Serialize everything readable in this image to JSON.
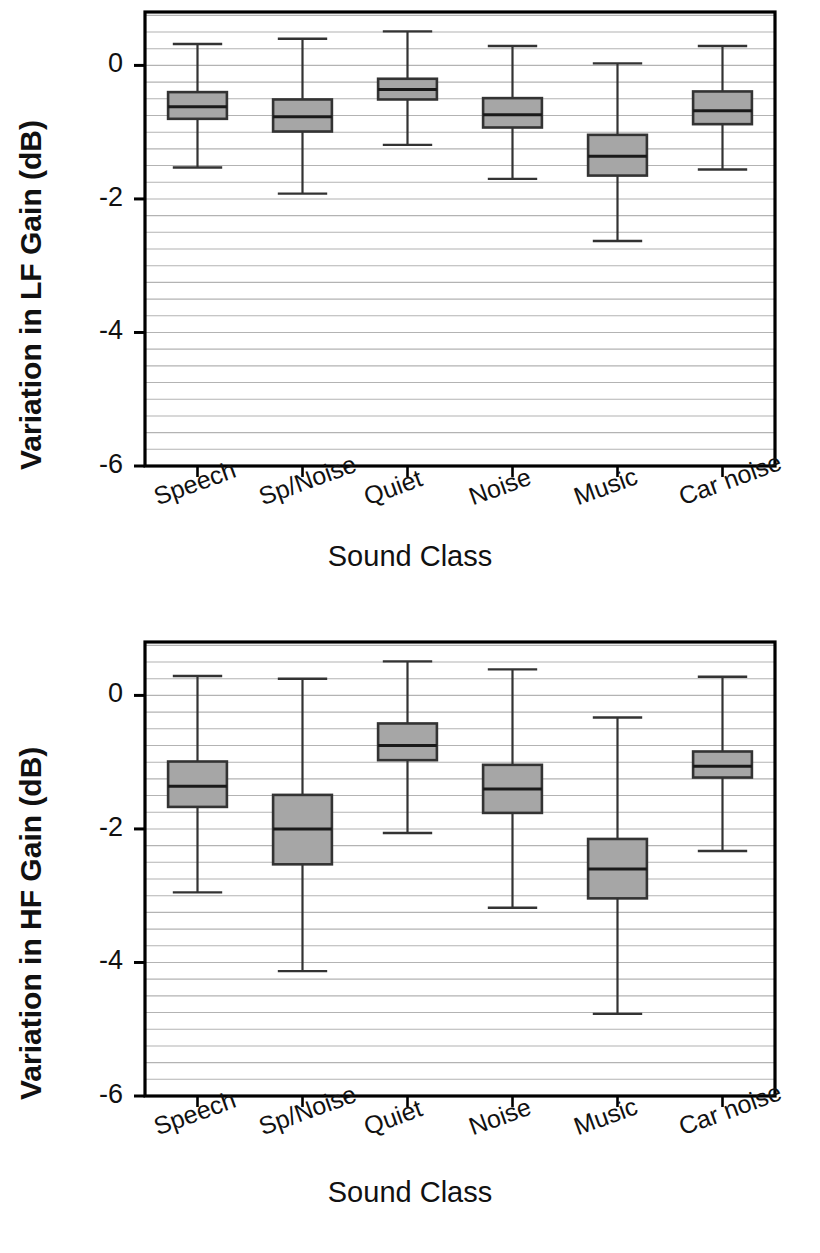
{
  "figure": {
    "background": "#ffffff",
    "box_fill": "#a6a6a6",
    "line_color": "#333333",
    "grid_color": "#9a9a9a",
    "axis_color": "#000000"
  },
  "panels": [
    {
      "id": "lf",
      "ylabel": "Variation in LF Gain (dB)",
      "xlabel": "Sound Class",
      "ytick_labels": [
        "0",
        "-2",
        "-4",
        "-6"
      ],
      "ytick_values": [
        0,
        -2,
        -4,
        -6
      ],
      "categories": [
        "Speech",
        "Sp/Noise",
        "Quiet",
        "Noise",
        "Music",
        "Car noise"
      ]
    },
    {
      "id": "hf",
      "ylabel": "Variation in HF Gain (dB)",
      "xlabel": "Sound Class",
      "ytick_labels": [
        "0",
        "-2",
        "-4",
        "-6"
      ],
      "ytick_values": [
        0,
        -2,
        -4,
        -6
      ],
      "categories": [
        "Speech",
        "Sp/Noise",
        "Quiet",
        "Noise",
        "Music",
        "Car noise"
      ]
    }
  ],
  "chart_data": [
    {
      "type": "box",
      "id": "lf-boxplot",
      "title": "",
      "xlabel": "Sound Class",
      "ylabel": "Variation in LF Gain (dB)",
      "ylim": [
        -6.0,
        0.8
      ],
      "yticks": [
        0,
        -2,
        -4,
        -6
      ],
      "minor_gridline_step": 0.25,
      "grid": true,
      "legend": "none",
      "categories": [
        "Speech",
        "Sp/Noise",
        "Quiet",
        "Noise",
        "Music",
        "Car noise"
      ],
      "boxes": [
        {
          "category": "Speech",
          "whisker_high": 0.32,
          "q3": -0.4,
          "median": -0.62,
          "q1": -0.8,
          "whisker_low": -1.53
        },
        {
          "category": "Sp/Noise",
          "whisker_high": 0.4,
          "q3": -0.51,
          "median": -0.77,
          "q1": -0.99,
          "whisker_low": -1.92
        },
        {
          "category": "Quiet",
          "whisker_high": 0.51,
          "q3": -0.2,
          "median": -0.36,
          "q1": -0.51,
          "whisker_low": -1.19
        },
        {
          "category": "Noise",
          "whisker_high": 0.29,
          "q3": -0.49,
          "median": -0.74,
          "q1": -0.93,
          "whisker_low": -1.7
        },
        {
          "category": "Music",
          "whisker_high": 0.03,
          "q3": -1.04,
          "median": -1.36,
          "q1": -1.65,
          "whisker_low": -2.63
        },
        {
          "category": "Car noise",
          "whisker_high": 0.29,
          "q3": -0.39,
          "median": -0.68,
          "q1": -0.88,
          "whisker_low": -1.56
        }
      ]
    },
    {
      "type": "box",
      "id": "hf-boxplot",
      "title": "",
      "xlabel": "Sound Class",
      "ylabel": "Variation in HF Gain (dB)",
      "ylim": [
        -6.0,
        0.8
      ],
      "yticks": [
        0,
        -2,
        -4,
        -6
      ],
      "minor_gridline_step": 0.25,
      "grid": true,
      "legend": "none",
      "categories": [
        "Speech",
        "Sp/Noise",
        "Quiet",
        "Noise",
        "Music",
        "Car noise"
      ],
      "boxes": [
        {
          "category": "Speech",
          "whisker_high": 0.29,
          "q3": -0.99,
          "median": -1.36,
          "q1": -1.67,
          "whisker_low": -2.95
        },
        {
          "category": "Sp/Noise",
          "whisker_high": 0.25,
          "q3": -1.49,
          "median": -2.0,
          "q1": -2.53,
          "whisker_low": -4.13
        },
        {
          "category": "Quiet",
          "whisker_high": 0.51,
          "q3": -0.42,
          "median": -0.75,
          "q1": -0.97,
          "whisker_low": -2.06
        },
        {
          "category": "Noise",
          "whisker_high": 0.39,
          "q3": -1.04,
          "median": -1.4,
          "q1": -1.76,
          "whisker_low": -3.18
        },
        {
          "category": "Music",
          "whisker_high": -0.33,
          "q3": -2.15,
          "median": -2.6,
          "q1": -3.04,
          "whisker_low": -4.77
        },
        {
          "category": "Car noise",
          "whisker_high": 0.28,
          "q3": -0.84,
          "median": -1.06,
          "q1": -1.23,
          "whisker_low": -2.33
        }
      ]
    }
  ]
}
